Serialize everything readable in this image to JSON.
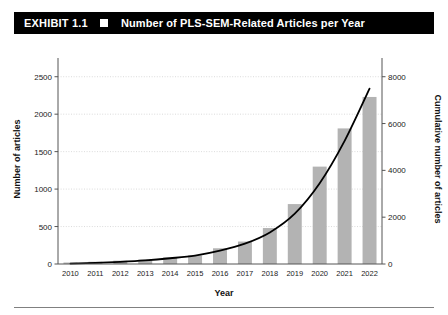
{
  "header": {
    "exhibit_number": "EXHIBIT 1.1",
    "marker_icon": "white-square-icon",
    "title": "Number of PLS-SEM-Related Articles per Year"
  },
  "chart_data": {
    "type": "bar",
    "title": "Number of PLS-SEM-Related Articles per Year",
    "xlabel": "Year",
    "ylabel": "Number of articles",
    "y2label": "Cumulative number of articles",
    "categories": [
      "2010",
      "2011",
      "2012",
      "2013",
      "2014",
      "2015",
      "2016",
      "2017",
      "2018",
      "2019",
      "2020",
      "2021",
      "2022"
    ],
    "series": [
      {
        "name": "Number of articles",
        "type": "bar",
        "axis": "left",
        "color": "#b3b3b3",
        "values": [
          20,
          30,
          45,
          60,
          90,
          115,
          210,
          300,
          480,
          800,
          1300,
          1810,
          2230
        ]
      },
      {
        "name": "Cumulative number of articles",
        "type": "line",
        "axis": "right",
        "color": "#000000",
        "values": [
          20,
          50,
          95,
          155,
          245,
          360,
          570,
          870,
          1350,
          2150,
          3450,
          5260,
          7490
        ]
      }
    ],
    "ylim": [
      0,
      2750
    ],
    "yticks": [
      0,
      500,
      1000,
      1500,
      2000,
      2500
    ],
    "ytick_labels": [
      "0",
      "500",
      "1000",
      "1500",
      "2000",
      "2500"
    ],
    "y2lim": [
      0,
      8800
    ],
    "y2ticks": [
      0,
      2000,
      4000,
      6000,
      8000
    ],
    "y2tick_labels": [
      "0",
      "2000",
      "4000",
      "6000",
      "8000"
    ],
    "grid": true,
    "legend": "none"
  }
}
